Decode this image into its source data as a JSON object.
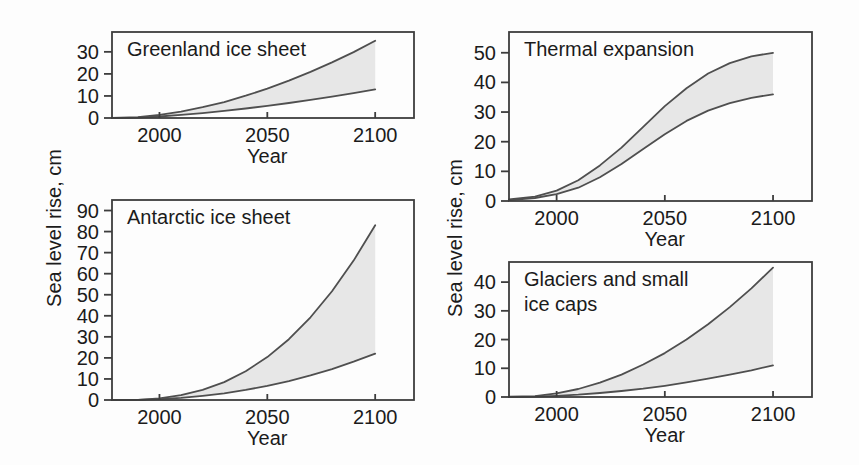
{
  "figure": {
    "background": "#fdfdfd",
    "text_color": "#1b1b1b",
    "axis_color": "#3d3d3d",
    "curve_color": "#4f4f4f",
    "band_fill": "#e7e7e7",
    "left_axis_label": "Sea level rise, cm",
    "right_axis_label": "Sea level rise, cm"
  },
  "chart_data": [
    {
      "id": "greenland",
      "type": "area",
      "title": "Greenland ice sheet",
      "title_lines": [
        "Greenland ice sheet"
      ],
      "xlabel": "Year",
      "ylabel": "Sea level rise, cm",
      "xlim": [
        1978,
        2118
      ],
      "ylim": [
        0,
        39
      ],
      "xticks": [
        2000,
        2050,
        2100
      ],
      "yticks": [
        0,
        10,
        20,
        30
      ],
      "x": [
        1978,
        1990,
        2000,
        2010,
        2020,
        2030,
        2040,
        2050,
        2060,
        2070,
        2080,
        2090,
        2100
      ],
      "series": [
        {
          "name": "upper bound",
          "values": [
            0.1,
            0.4,
            1.4,
            2.9,
            4.9,
            7.2,
            10.1,
            13.3,
            16.9,
            20.9,
            25.2,
            29.9,
            35
          ]
        },
        {
          "name": "lower bound",
          "values": [
            0,
            0.2,
            0.7,
            1.4,
            2.2,
            3.2,
            4.3,
            5.5,
            6.8,
            8.2,
            9.7,
            11.3,
            13
          ]
        }
      ]
    },
    {
      "id": "thermal",
      "type": "area",
      "title": "Thermal expansion",
      "title_lines": [
        "Thermal expansion"
      ],
      "xlabel": "Year",
      "ylabel": "Sea level rise, cm",
      "xlim": [
        1978,
        2118
      ],
      "ylim": [
        0,
        57
      ],
      "xticks": [
        2000,
        2050,
        2100
      ],
      "yticks": [
        0,
        10,
        20,
        30,
        40,
        50
      ],
      "x": [
        1978,
        1990,
        2000,
        2010,
        2020,
        2030,
        2040,
        2050,
        2060,
        2070,
        2080,
        2090,
        2100
      ],
      "series": [
        {
          "name": "upper bound",
          "values": [
            0.5,
            1.5,
            3.5,
            7,
            12,
            18,
            25,
            32,
            38,
            43,
            46.5,
            48.8,
            50
          ]
        },
        {
          "name": "lower bound",
          "values": [
            0.3,
            1,
            2.3,
            4.5,
            8,
            12.5,
            17.5,
            22.5,
            27,
            30.5,
            33,
            34.8,
            36
          ]
        }
      ]
    },
    {
      "id": "antarctic",
      "type": "area",
      "title": "Antarctic ice sheet",
      "title_lines": [
        "Antarctic ice sheet"
      ],
      "xlabel": "Year",
      "ylabel": "Sea level rise, cm",
      "xlim": [
        1978,
        2118
      ],
      "ylim": [
        0,
        95
      ],
      "xticks": [
        2000,
        2050,
        2100
      ],
      "yticks": [
        0,
        10,
        20,
        30,
        40,
        50,
        60,
        70,
        80,
        90
      ],
      "x": [
        1978,
        1990,
        2000,
        2010,
        2020,
        2030,
        2040,
        2050,
        2060,
        2070,
        2080,
        2090,
        2100
      ],
      "series": [
        {
          "name": "upper bound",
          "values": [
            0,
            0.1,
            0.8,
            2.3,
            4.8,
            8.5,
            13.7,
            20.4,
            28.9,
            39.3,
            51.7,
            66.2,
            83
          ]
        },
        {
          "name": "lower bound",
          "values": [
            0,
            0.1,
            0.4,
            1.0,
            2.0,
            3.2,
            4.8,
            6.7,
            9.0,
            11.7,
            14.7,
            18.2,
            22
          ]
        }
      ]
    },
    {
      "id": "glaciers",
      "type": "area",
      "title": "Glaciers and small ice caps",
      "title_lines": [
        "Glaciers and small",
        "ice caps"
      ],
      "xlabel": "Year",
      "ylabel": "Sea level rise, cm",
      "xlim": [
        1978,
        2118
      ],
      "ylim": [
        0,
        47
      ],
      "xticks": [
        2000,
        2050,
        2100
      ],
      "yticks": [
        0,
        10,
        20,
        30,
        40
      ],
      "x": [
        1978,
        1990,
        2000,
        2010,
        2020,
        2030,
        2040,
        2050,
        2060,
        2070,
        2080,
        2090,
        2100
      ],
      "series": [
        {
          "name": "upper bound",
          "values": [
            0.1,
            0.3,
            1.3,
            2.8,
            5,
            7.8,
            11.3,
            15.3,
            20,
            25.3,
            31.3,
            37.8,
            45
          ]
        },
        {
          "name": "lower bound",
          "values": [
            0,
            0.1,
            0.4,
            0.8,
            1.4,
            2.1,
            2.9,
            3.9,
            5.1,
            6.4,
            7.8,
            9.3,
            11
          ]
        }
      ]
    }
  ]
}
